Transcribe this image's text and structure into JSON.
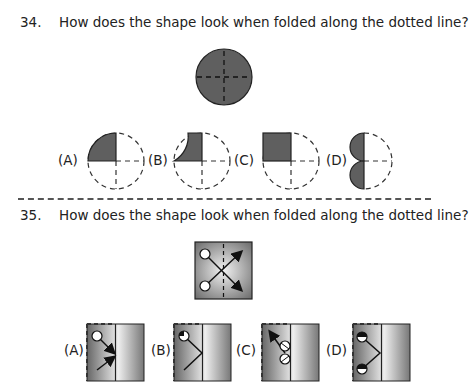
{
  "questions": [
    {
      "number": "34.",
      "text": "How does the shape look when folded along the dotted line?",
      "options": [
        "(A)",
        "(B)",
        "(C)",
        "(D)"
      ]
    },
    {
      "number": "35.",
      "text": "How does the shape look when folded along the dotted line?",
      "options": [
        "(A)",
        "(B)",
        "(C)",
        "(D)"
      ]
    }
  ],
  "colors": {
    "fill_dark": "#5f5f5f",
    "outline": "#222222",
    "gradient_light": "#eeeeee",
    "gradient_dark": "#6a6a6a"
  }
}
